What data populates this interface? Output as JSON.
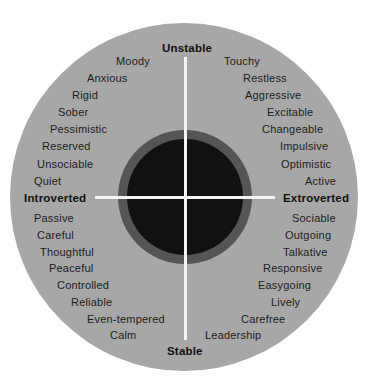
{
  "diagram": {
    "axes": {
      "top": "Unstable",
      "bottom": "Stable",
      "left": "Introverted",
      "right": "Extroverted"
    },
    "quadrants": {
      "unstable_introverted": [
        "Moody",
        "Anxious",
        "Rigid",
        "Sober",
        "Pessimistic",
        "Reserved",
        "Unsociable",
        "Quiet"
      ],
      "unstable_extroverted": [
        "Touchy",
        "Restless",
        "Aggressive",
        "Excitable",
        "Changeable",
        "Impulsive",
        "Optimistic",
        "Active"
      ],
      "stable_introverted": [
        "Passive",
        "Careful",
        "Thoughtful",
        "Peaceful",
        "Controlled",
        "Reliable",
        "Even-tempered",
        "Calm"
      ],
      "stable_extroverted": [
        "Sociable",
        "Outgoing",
        "Talkative",
        "Responsive",
        "Easygoing",
        "Lively",
        "Carefree",
        "Leadership"
      ]
    },
    "colors": {
      "outer_circle": "#a7a7a7",
      "inner_ring": "#555555",
      "inner_core": "#111113",
      "axis_lines": "#f4f4f4",
      "text": "#1c1c1c"
    }
  }
}
